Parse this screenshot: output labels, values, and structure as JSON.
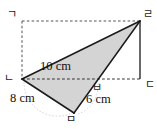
{
  "figure": {
    "background_color": "#ffffff",
    "shade_color": "#d4d4d4",
    "solid_line_color": "#1a1a1a",
    "dashed_line_color": "#4d4d4d",
    "vertices": [
      {
        "id": "ga",
        "label": "ㄱ",
        "name": "vertex-top-left"
      },
      {
        "id": "ra",
        "label": "ㄹ",
        "name": "vertex-top-right"
      },
      {
        "id": "na",
        "label": "ㄴ",
        "name": "vertex-bottom-left"
      },
      {
        "id": "da",
        "label": "ㄷ",
        "name": "vertex-bottom-right"
      },
      {
        "id": "ba",
        "label": "ㅂ",
        "name": "vertex-intersection"
      },
      {
        "id": "ma",
        "label": "ㅁ",
        "name": "vertex-apex-below"
      }
    ],
    "measurements": [
      {
        "id": "ten",
        "label": "10 cm",
        "segment": "na-ra"
      },
      {
        "id": "eight",
        "label": "8 cm",
        "segment": "na-ma"
      },
      {
        "id": "six",
        "label": "6 cm",
        "segment": "ma-ra"
      }
    ]
  }
}
